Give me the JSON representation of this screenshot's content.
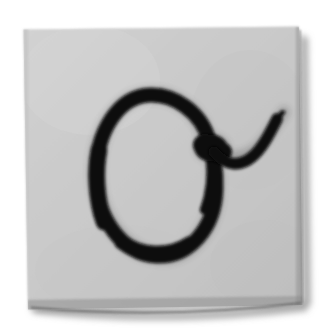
{
  "image": {
    "kind": "photograph-of-handwriting",
    "width": 325,
    "height": 332,
    "background_color": "#ffffff",
    "alt_text": "A light gray square card photographed on a white background, bearing a large handwritten black letter O with a curling tail."
  },
  "card": {
    "label": "paper-card",
    "surface_color": "#c8c8c8",
    "surface_color_light": "#d2d2d2",
    "surface_color_dark": "#bdbdbd",
    "texture": "woven-canvas",
    "edge_shadow_color": "#6e6e6e",
    "drop_shadow_color": "#9a9a9a",
    "bounds": {
      "left": 22,
      "top": 28,
      "right": 302,
      "bottom": 310
    }
  },
  "glyph": {
    "label": "letter-o",
    "character": "O",
    "script_style": "handwritten-cursive",
    "ink_color": "#0a0a0a",
    "ink_color_soft": "#1d1d1d",
    "stroke_width": 15,
    "parts": [
      {
        "name": "oval-loop",
        "description": "large counter-clockwise oval bowl"
      },
      {
        "name": "ink-blob",
        "description": "thick knot where strokes cross",
        "cx": 212,
        "cy": 148,
        "rx": 17,
        "ry": 14
      },
      {
        "name": "tail-flourish",
        "description": "tapering tail sweeping right then curling upward",
        "end_x": 284,
        "end_y": 112
      }
    ],
    "loop_bounds": {
      "left": 96,
      "top": 95,
      "right": 216,
      "bottom": 256
    }
  }
}
